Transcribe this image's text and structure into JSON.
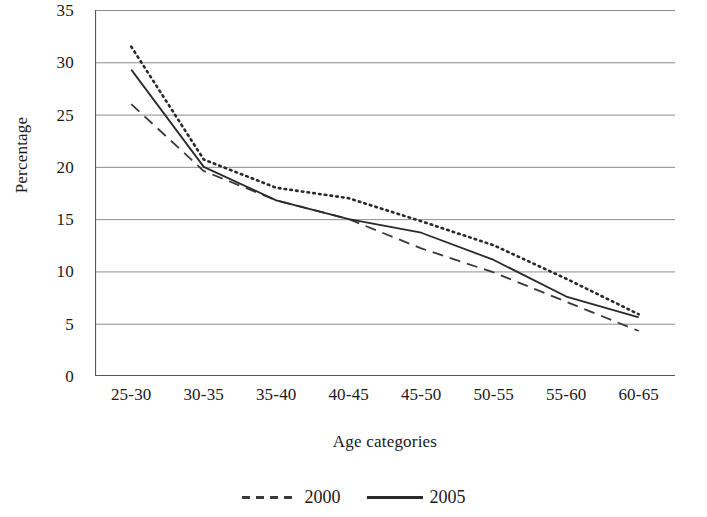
{
  "chart_data": {
    "type": "line",
    "title": "",
    "xlabel": "Age categories",
    "ylabel": "Percentage",
    "categories": [
      "25-30",
      "30-35",
      "35-40",
      "40-45",
      "45-50",
      "50-55",
      "55-60",
      "60-65"
    ],
    "ylim": [
      0,
      35
    ],
    "yticks": [
      "0",
      "5",
      "10",
      "15",
      "20",
      "25",
      "30",
      "35"
    ],
    "ytick_values": [
      0,
      5,
      10,
      15,
      20,
      25,
      30,
      35
    ],
    "grid": "horizontal",
    "legend_position": "bottom",
    "series": [
      {
        "name": "2000",
        "style": "dashed",
        "color": "#3a3a3a",
        "values": [
          26.0,
          19.6,
          16.8,
          15.0,
          12.2,
          9.9,
          7.1,
          4.3
        ]
      },
      {
        "name": "2005",
        "style": "solid",
        "color": "#2a2a2a",
        "values": [
          29.3,
          20.0,
          16.8,
          15.0,
          13.7,
          11.1,
          7.6,
          5.6
        ]
      },
      {
        "name": "",
        "style": "dotted",
        "color": "#2a2a2a",
        "values": [
          31.5,
          20.7,
          18.0,
          17.0,
          14.8,
          12.5,
          9.3,
          5.9
        ]
      }
    ]
  },
  "legend": {
    "items": [
      {
        "label": "2000",
        "style": "dashed"
      },
      {
        "label": "2005",
        "style": "solid"
      }
    ]
  }
}
